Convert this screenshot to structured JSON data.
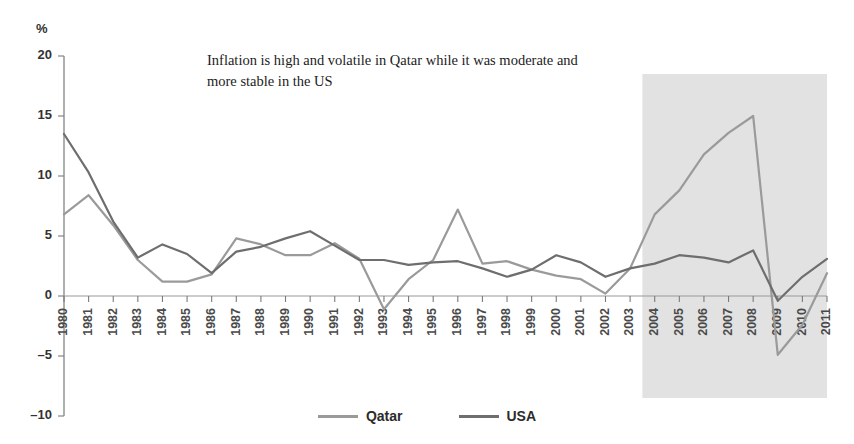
{
  "annotation": {
    "line1": "Inflation is high and volatile in Qatar while it was moderate and",
    "line2": "more stable in the US"
  },
  "axis": {
    "unit_label": "%"
  },
  "legend": {
    "items": [
      {
        "label": "Qatar",
        "color": "#9a9a9a"
      },
      {
        "label": "USA",
        "color": "#6e6e6e"
      }
    ]
  },
  "colors": {
    "qatar": "#9a9a9a",
    "usa": "#6e6e6e",
    "shade": "#e2e2e2",
    "axis": "#7a7a7a"
  },
  "highlight": {
    "start_year": "2004",
    "end_year": "2011",
    "top_value": 18.5,
    "bottom_value": -8.5
  },
  "chart_data": {
    "type": "line",
    "title": "",
    "xlabel": "",
    "ylabel": "%",
    "ylim": [
      -10,
      20
    ],
    "yticks": [
      20,
      15,
      10,
      5,
      0,
      -5,
      -10
    ],
    "grid": false,
    "legend_position": "bottom",
    "categories": [
      "1980",
      "1981",
      "1982",
      "1983",
      "1984",
      "1985",
      "1986",
      "1987",
      "1988",
      "1989",
      "1990",
      "1991",
      "1992",
      "1993",
      "1994",
      "1995",
      "1996",
      "1997",
      "1998",
      "1999",
      "2000",
      "2001",
      "2002",
      "2003",
      "2004",
      "2005",
      "2006",
      "2007",
      "2008",
      "2009",
      "2010",
      "2011"
    ],
    "series": [
      {
        "name": "Qatar",
        "color": "#9a9a9a",
        "values": [
          6.8,
          8.4,
          5.9,
          3.0,
          1.2,
          1.2,
          1.8,
          4.8,
          4.3,
          3.4,
          3.4,
          4.4,
          3.1,
          -1.1,
          1.4,
          3.0,
          7.2,
          2.7,
          2.9,
          2.2,
          1.7,
          1.4,
          0.2,
          2.3,
          6.8,
          8.8,
          11.8,
          13.6,
          15.0,
          -4.9,
          -2.4,
          1.9
        ]
      },
      {
        "name": "USA",
        "color": "#6e6e6e",
        "values": [
          13.5,
          10.3,
          6.2,
          3.2,
          4.3,
          3.5,
          1.9,
          3.7,
          4.1,
          4.8,
          5.4,
          4.2,
          3.0,
          3.0,
          2.6,
          2.8,
          2.9,
          2.3,
          1.6,
          2.2,
          3.4,
          2.8,
          1.6,
          2.3,
          2.7,
          3.4,
          3.2,
          2.8,
          3.8,
          -0.4,
          1.6,
          3.1
        ]
      }
    ],
    "annotations": [
      "Inflation is high and volatile in Qatar while it was moderate and more stable in the US"
    ]
  }
}
